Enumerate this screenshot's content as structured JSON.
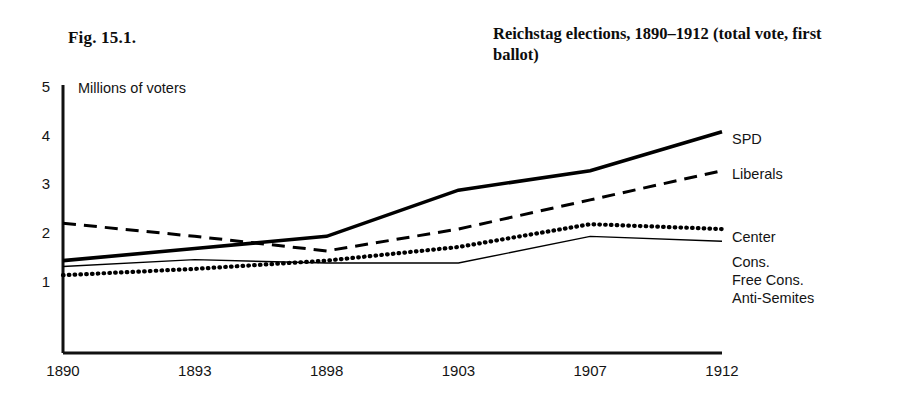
{
  "figure": {
    "number_label": "Fig. 15.1.",
    "title": "Reichstag elections, 1890–1912 (total vote, first ballot)",
    "axis_unit_note": "Millions of voters"
  },
  "chart_data": {
    "type": "line",
    "title": "Reichstag elections, 1890–1912 (total vote, first ballot)",
    "xlabel": "",
    "ylabel": "Millions of voters",
    "categories": [
      "1890",
      "1893",
      "1898",
      "1903",
      "1907",
      "1912"
    ],
    "xticklabels": [
      "1890",
      "1893",
      "1898",
      "1903",
      "1907",
      "1912"
    ],
    "yticklabels": [
      "1",
      "2",
      "3",
      "4",
      "5"
    ],
    "ylim": [
      0,
      5
    ],
    "yticks": [
      1,
      2,
      3,
      4,
      5
    ],
    "grid": false,
    "legend": "inline-right-end-labels",
    "series": [
      {
        "name": "SPD",
        "style": "thick-solid",
        "color": "#000000",
        "values": [
          1.45,
          1.7,
          1.95,
          2.9,
          3.3,
          4.1
        ]
      },
      {
        "name": "Liberals",
        "style": "dashed",
        "color": "#000000",
        "values": [
          2.22,
          1.95,
          1.65,
          2.1,
          2.7,
          3.3
        ]
      },
      {
        "name": "Center",
        "style": "dotted",
        "color": "#000000",
        "values": [
          1.15,
          1.28,
          1.45,
          1.73,
          2.2,
          2.1
        ]
      },
      {
        "name": "Cons.",
        "style": "thin-solid",
        "color": "#000000",
        "values": [
          1.33,
          1.47,
          1.4,
          1.4,
          1.95,
          1.85
        ]
      }
    ],
    "end_labels": [
      "SPD",
      "Liberals",
      "Center",
      "Cons.",
      "Free Cons.",
      "Anti-Semites"
    ]
  }
}
